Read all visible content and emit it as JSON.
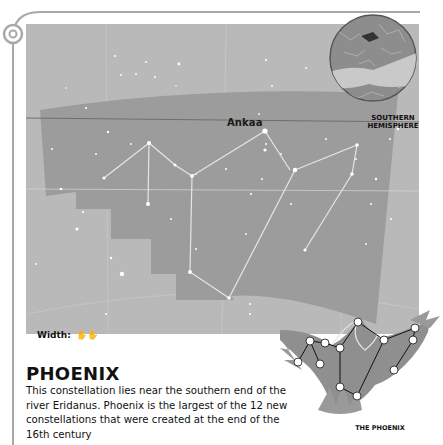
{
  "map": {
    "star_label": "Ankaa",
    "inset_label_line1": "SOUTHERN",
    "inset_label_line2": "HEMISPHERE",
    "width_label": "Width:",
    "width_icon": "hands-span-icon",
    "width_icon_glyph": "✋✋"
  },
  "article": {
    "title": "PHOENIX",
    "description": "This constellation lies near the southern end of the river Eridanus. Phoenix is the largest of the 12 new constellations that were created at the end of the 16th century"
  },
  "illustration": {
    "caption": "THE PHOENIX"
  },
  "colors": {
    "sky": "#b9b9b9",
    "constellation_area": "#9c9c9c",
    "frame": "#a8a8a8",
    "text": "#111111"
  }
}
